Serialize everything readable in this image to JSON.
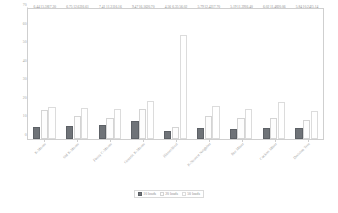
{
  "chart_data": {
    "type": "bar",
    "title": "",
    "xlabel": "",
    "ylabel": "Time in seconds",
    "ylim": [
      0,
      70
    ],
    "yticks": [
      0,
      10,
      20,
      30,
      40,
      50,
      60,
      70
    ],
    "grid": false,
    "legend_position": "bottom",
    "categories": [
      "K-Means",
      "Std K-Means",
      "Fuzzy C-Means",
      "Genetic K-Means",
      "Hierarchical",
      "K-Nearest Neighbor",
      "Bee Miner",
      "Cuckoo Miner",
      "Decision Tree"
    ],
    "series": [
      {
        "name": "10 loads",
        "color": "#6f7378",
        "values": [
          6.44,
          6.75,
          7.41,
          9.47,
          4.56,
          5.79,
          5.19,
          6.02,
          5.84
        ]
      },
      {
        "name": "20 loads",
        "color": "#fdfdfd",
        "values": [
          15.38,
          12.62,
          11.31,
          16.16,
          6.35,
          12.42,
          11.39,
          11.48,
          10.24
        ]
      },
      {
        "name": "50 loads",
        "color": "#ffffff",
        "values": [
          17.3,
          16.61,
          16.16,
          20.7,
          56.02,
          17.7,
          16.4,
          20.06,
          15.14
        ]
      }
    ]
  },
  "legend": {
    "items": [
      {
        "label": "10 loads"
      },
      {
        "label": "20 loads"
      },
      {
        "label": "50 loads"
      }
    ]
  }
}
